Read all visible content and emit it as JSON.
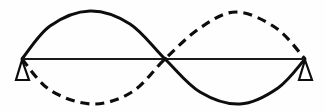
{
  "figure": {
    "width": 326,
    "height": 112,
    "background_color": "#fefefe",
    "ink_color": "#0d0d0d"
  },
  "chart_data": {
    "type": "line",
    "xlabel": "",
    "ylabel": "",
    "xlim": [
      22,
      305
    ],
    "ylim": [
      104,
      11
    ],
    "grid": false,
    "legend_position": "none",
    "axis_line": {
      "name": "beam-axis",
      "x_start": 22,
      "x_end": 305,
      "y": 59
    },
    "series": [
      {
        "name": "mode-shape-solid",
        "style": "solid",
        "color": "#0d0d0d",
        "x": [
          22,
          50,
          90,
          130,
          165,
          200,
          240,
          278,
          305
        ],
        "y": [
          59,
          26,
          11,
          24,
          59,
          92,
          104,
          88,
          59
        ]
      },
      {
        "name": "mode-shape-dashed",
        "style": "dashed",
        "color": "#0d0d0d",
        "dash_length": 9,
        "dash_gap": 6,
        "x": [
          22,
          50,
          92,
          132,
          165,
          200,
          236,
          276,
          305
        ],
        "y": [
          59,
          90,
          104,
          92,
          59,
          28,
          12,
          28,
          59
        ]
      }
    ],
    "annotations": [
      {
        "name": "node-midspan",
        "x": 165,
        "y": 59,
        "label": ""
      }
    ]
  },
  "supports": [
    {
      "name": "support-left",
      "type": "pin-support-triangle",
      "apex_x": 22,
      "apex_y": 60,
      "base_left_x": 16,
      "base_right_x": 29,
      "base_y": 80
    },
    {
      "name": "support-right",
      "type": "pin-support-triangle",
      "apex_x": 305,
      "apex_y": 60,
      "base_left_x": 299,
      "base_right_x": 312,
      "base_y": 80
    }
  ]
}
